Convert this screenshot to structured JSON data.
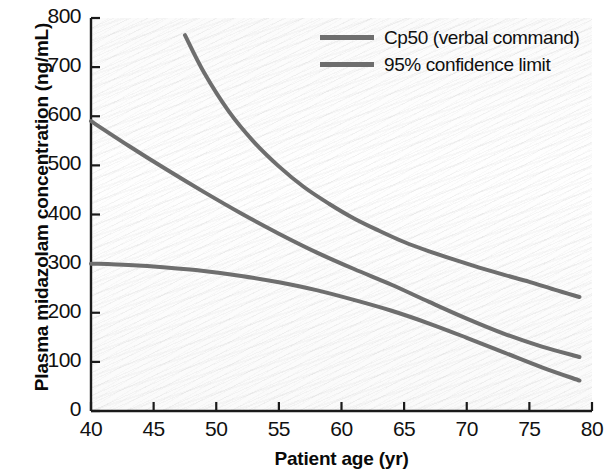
{
  "chart_data": {
    "type": "line",
    "title": "",
    "xlabel": "Patient age (yr)",
    "ylabel": "Plasma midazolam concentration (ng/mL)",
    "xlim": [
      40,
      80
    ],
    "ylim": [
      0,
      800
    ],
    "xticks": [
      40,
      45,
      50,
      55,
      60,
      65,
      70,
      75,
      80
    ],
    "yticks": [
      0,
      100,
      200,
      300,
      400,
      500,
      600,
      700,
      800
    ],
    "xtick_labels": [
      "40",
      "45",
      "50",
      "55",
      "60",
      "65",
      "70",
      "75",
      "80"
    ],
    "ytick_labels": [
      "0",
      "100",
      "200",
      "300",
      "400",
      "500",
      "600",
      "700",
      "800"
    ],
    "grid": false,
    "legend_position": "top-right",
    "line_color": "#6e6e6e",
    "series": [
      {
        "name": "95% confidence limit (upper)",
        "legend_entry": "95% confidence limit",
        "color": "#6e6e6e",
        "x": [
          47.5,
          49,
          51,
          53,
          55,
          57,
          59,
          61,
          63,
          65,
          67,
          69,
          71,
          73,
          75,
          77,
          79
        ],
        "values": [
          765,
          690,
          610,
          548,
          498,
          456,
          422,
          392,
          367,
          344,
          325,
          308,
          292,
          277,
          263,
          247,
          232
        ]
      },
      {
        "name": "Cp50 (verbal command)",
        "legend_entry": "Cp50 (verbal command)",
        "color": "#6e6e6e",
        "x": [
          40,
          43,
          46,
          49,
          52,
          55,
          58,
          61,
          64,
          67,
          70,
          73,
          76,
          79
        ],
        "values": [
          590,
          540,
          492,
          446,
          402,
          361,
          323,
          289,
          257,
          222,
          188,
          157,
          131,
          110
        ]
      },
      {
        "name": "95% confidence limit (lower)",
        "legend_entry": "95% confidence limit",
        "color": "#6e6e6e",
        "x": [
          40,
          43,
          46,
          49,
          52,
          55,
          58,
          61,
          64,
          67,
          70,
          73,
          76,
          79
        ],
        "values": [
          300,
          297,
          292,
          285,
          275,
          262,
          246,
          226,
          204,
          178,
          149,
          119,
          89,
          62
        ]
      }
    ]
  },
  "legend": {
    "items": [
      {
        "label": "Cp50 (verbal command)"
      },
      {
        "label": "95% confidence limit"
      }
    ]
  },
  "axes": {
    "ylabel": "Plasma midazolam concentration (ng/mL)",
    "xlabel": "Patient age (yr)"
  }
}
